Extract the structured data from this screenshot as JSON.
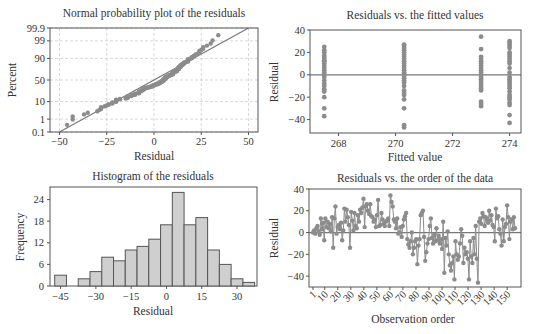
{
  "chart_data": [
    {
      "type": "scatter",
      "title": "Normal probability plot of the residuals",
      "xlabel": "Residual",
      "ylabel": "Percent",
      "xlim": [
        -55,
        55
      ],
      "x_ticks": [
        -50,
        -25,
        0,
        25,
        50
      ],
      "y_ticks": [
        "0.1",
        "1",
        "10",
        "50",
        "90",
        "99",
        "99.9"
      ],
      "grid": true,
      "reference_line": {
        "from": [
          -50,
          0.1
        ],
        "to": [
          50,
          99.9
        ]
      },
      "legend": null
    },
    {
      "type": "scatter",
      "title": "Residuals vs. the fitted values",
      "xlabel": "Fitted value",
      "ylabel": "Residual",
      "xlim": [
        267,
        274.4
      ],
      "ylim": [
        -52,
        40
      ],
      "x_ticks": [
        268,
        270,
        272,
        274
      ],
      "y_ticks": [
        40,
        20,
        0,
        -20,
        -40
      ],
      "reference_line_y": 0,
      "groups": [
        {
          "fitted": 267.5,
          "residuals": [
            25,
            22,
            20,
            17,
            15,
            13,
            12,
            10,
            8,
            6,
            4,
            2,
            0,
            -2,
            -5,
            -8,
            -10,
            -13,
            -15,
            -20,
            -30,
            -37
          ]
        },
        {
          "fitted": 270.3,
          "residuals": [
            27,
            26,
            24,
            22,
            20,
            18,
            16,
            14,
            12,
            10,
            8,
            6,
            4,
            2,
            1,
            0,
            -1,
            -3,
            -5,
            -7,
            -10,
            -14,
            -16,
            -18,
            -22,
            -30,
            -45,
            -47
          ]
        },
        {
          "fitted": 273.0,
          "residuals": [
            34,
            23,
            16,
            14,
            12,
            10,
            8,
            6,
            4,
            2,
            0,
            -2,
            -4,
            -6,
            -8,
            -10,
            -12,
            -14,
            -24,
            -26,
            -28
          ]
        },
        {
          "fitted": 274.0,
          "residuals": [
            30,
            28,
            26,
            24,
            20,
            18,
            16,
            14,
            12,
            10,
            6,
            2,
            -2,
            -4,
            -6,
            -8,
            -10,
            -12,
            -15,
            -18,
            -20,
            -22,
            -25,
            -27,
            -36,
            -43
          ]
        }
      ]
    },
    {
      "type": "bar",
      "title": "Histogram of the residuals",
      "xlabel": "Residual",
      "ylabel": "Frequency",
      "categories": [
        -45,
        -40,
        -35,
        -30,
        -25,
        -20,
        -15,
        -10,
        -5,
        0,
        5,
        10,
        15,
        20,
        25,
        30,
        35
      ],
      "values": [
        3,
        0,
        2,
        4,
        8,
        7,
        10,
        11,
        13,
        17,
        26,
        17,
        19,
        10,
        6,
        2,
        1
      ],
      "bin_width": 5,
      "x_ticks": [
        -45,
        -30,
        -15,
        0,
        15,
        30
      ],
      "y_ticks": [
        0,
        6,
        12,
        18,
        24
      ],
      "ylim": [
        0,
        27.5
      ]
    },
    {
      "type": "line",
      "title": "Residuals vs. the order of the data",
      "xlabel": "Observation order",
      "ylabel": "Residual",
      "x_ticks": [
        1,
        10,
        20,
        30,
        40,
        50,
        60,
        70,
        80,
        90,
        100,
        110,
        120,
        130,
        140,
        150
      ],
      "y_ticks": [
        40,
        20,
        0,
        -20,
        -40
      ],
      "ylim": [
        -50,
        40
      ],
      "xlim": [
        0,
        156
      ],
      "reference_line_y": 0,
      "values": [
        0,
        2,
        -1,
        4,
        6,
        1,
        -2,
        13,
        3,
        9,
        -7,
        13,
        5,
        10,
        4,
        8,
        1,
        14,
        -14,
        13,
        24,
        -1,
        5,
        7,
        3,
        9,
        -7,
        2,
        22,
        10,
        21,
        14,
        7,
        -14,
        19,
        11,
        2,
        18,
        6,
        4,
        16,
        10,
        21,
        18,
        23,
        31,
        5,
        24,
        26,
        20,
        17,
        26,
        15,
        14,
        10,
        12,
        5,
        16,
        30,
        6,
        7,
        18,
        12,
        8,
        6,
        10,
        11,
        13,
        6,
        34,
        28,
        24,
        12,
        10,
        4,
        13,
        -1,
        0,
        5,
        -4,
        6,
        12,
        15,
        18,
        -6,
        -11,
        -14,
        -8,
        0,
        -20,
        -14,
        -8,
        -6,
        -29,
        -12,
        -6,
        16,
        18,
        20,
        -4,
        -26,
        -18,
        -10,
        -6,
        6,
        13,
        -5,
        -10,
        -2,
        -8,
        4,
        -7,
        -3,
        -10,
        -6,
        -15,
        10,
        -37,
        -5,
        -12,
        1,
        -20,
        -30,
        -35,
        -28,
        -22,
        -43,
        -8,
        -20,
        -25,
        -22,
        -10,
        3,
        -3,
        -28,
        -14,
        -20,
        -18,
        -24,
        -43,
        -8,
        -22,
        -28,
        -5,
        -20,
        6,
        -24,
        -46,
        10,
        13,
        8,
        18,
        15,
        6,
        14,
        12,
        9,
        20,
        11,
        16,
        7,
        5,
        -8,
        22,
        13,
        15,
        3,
        -1,
        -12,
        12,
        -8,
        5,
        8,
        25,
        14,
        -6,
        10,
        12,
        3,
        14,
        4
      ]
    }
  ]
}
